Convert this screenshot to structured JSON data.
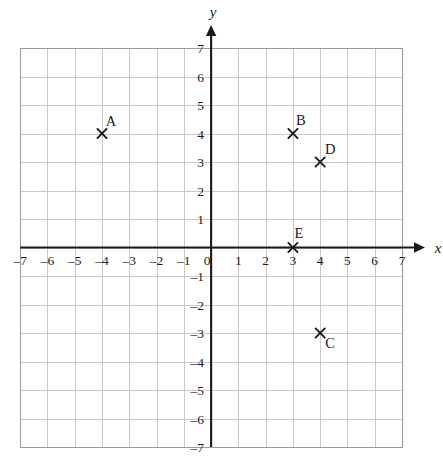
{
  "chart_data": {
    "type": "scatter",
    "title": "",
    "xlabel": "x",
    "ylabel": "y",
    "xlim": [
      -7,
      7
    ],
    "ylim": [
      -7,
      7
    ],
    "grid": true,
    "legend": "none",
    "x_ticks": [
      "-7",
      "-6",
      "-5",
      "-4",
      "-3",
      "-2",
      "-1",
      "0",
      "1",
      "2",
      "3",
      "4",
      "5",
      "6",
      "7"
    ],
    "y_ticks": [
      "-7",
      "-6",
      "-5",
      "-4",
      "-3",
      "-2",
      "-1",
      "1",
      "2",
      "3",
      "4",
      "5",
      "6",
      "7"
    ],
    "origin_label": "0",
    "points": [
      {
        "label": "A",
        "x": -4,
        "y": 4,
        "label_dx": 9,
        "label_dy": -8
      },
      {
        "label": "B",
        "x": 3,
        "y": 4,
        "label_dx": 8,
        "label_dy": -9
      },
      {
        "label": "C",
        "x": 4,
        "y": -3,
        "label_dx": 10,
        "label_dy": 15
      },
      {
        "label": "D",
        "x": 4,
        "y": 3,
        "label_dx": 10,
        "label_dy": -8
      },
      {
        "label": "E",
        "x": 3,
        "y": 0,
        "label_dx": 6,
        "label_dy": -10
      }
    ],
    "colors": {
      "grid": "#c9c9c9",
      "grid_border": "#9a9a9a",
      "axis": "#1a1a1a",
      "marker": "#1a1a1a",
      "text": "#1a1a1a",
      "background": "#ffffff"
    }
  }
}
